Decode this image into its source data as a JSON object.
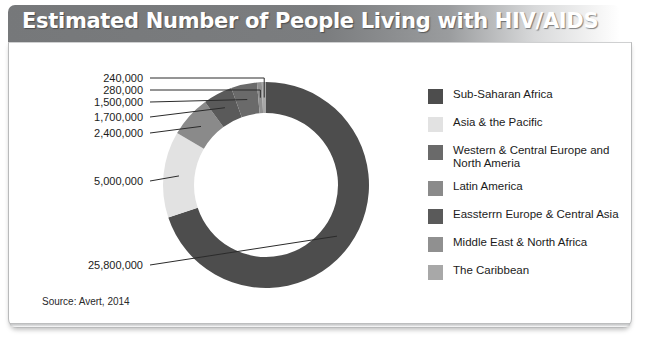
{
  "header": {
    "title": "Estimated Number of People Living with HIV/AIDS"
  },
  "source": {
    "text": "Source: Avert, 2014"
  },
  "legend": {
    "items": [
      {
        "label": "Sub-Saharan Africa",
        "color": "#4d4d4d"
      },
      {
        "label": "Asia & the Pacific",
        "color": "#e2e2e2"
      },
      {
        "label": "Western & Central Europe and North Ameria",
        "color": "#6a6a6a"
      },
      {
        "label": "Latin America",
        "color": "#8a8a8a"
      },
      {
        "label": "Eassterrn Europe & Central Asia",
        "color": "#5a5a5a"
      },
      {
        "label": "Middle East & North Africa",
        "color": "#909090"
      },
      {
        "label": "The Caribbean",
        "color": "#a8a8a8"
      }
    ]
  },
  "chart_data": {
    "type": "pie",
    "title": "Estimated Number of People Living with HIV/AIDS",
    "subtype": "donut",
    "legend_position": "right",
    "grid": false,
    "labels": [
      "Sub-Saharan Africa",
      "Asia & the Pacific",
      "Latin America",
      "Eassterrn Europe & Central Asia",
      "Western & Central Europe and North Ameria",
      "Middle East & North Africa",
      "The Caribbean"
    ],
    "categories": [
      "Sub-Saharan Africa",
      "Asia & the Pacific",
      "Latin America",
      "Eassterrn Europe & Central Asia",
      "Western & Central Europe and North Ameria",
      "Middle East & North Africa",
      "The Caribbean"
    ],
    "values": [
      25800000,
      5000000,
      2400000,
      1700000,
      1500000,
      280000,
      240000
    ],
    "value_labels": [
      "25,800,000",
      "5,000,000",
      "2,400,000",
      "1,700,000",
      "1,500,000",
      "280,000",
      "240,000"
    ],
    "colors": [
      "#4d4d4d",
      "#e2e2e2",
      "#8a8a8a",
      "#5a5a5a",
      "#6a6a6a",
      "#909090",
      "#a8a8a8"
    ],
    "total": 36920000,
    "units": "people"
  },
  "callouts": [
    {
      "value": "240,000",
      "y": 78
    },
    {
      "value": "280,000",
      "y": 90
    },
    {
      "value": "1,500,000",
      "y": 102
    },
    {
      "value": "1,700,000",
      "y": 117
    },
    {
      "value": "2,400,000",
      "y": 133
    },
    {
      "value": "5,000,000",
      "y": 181
    },
    {
      "value": "25,800,000",
      "y": 265
    }
  ]
}
